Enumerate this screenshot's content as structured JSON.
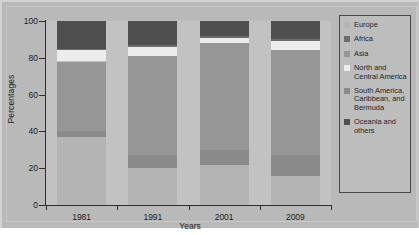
{
  "figure": {
    "background": "#b9b9b9",
    "plot_background": "#c2c2c2"
  },
  "chart_data": {
    "type": "bar",
    "subtype": "stacked-bar-100-percent",
    "title": "",
    "xlabel": "Years",
    "ylabel": "Percentages",
    "categories": [
      "1981",
      "1991",
      "2001",
      "2009"
    ],
    "ylim": [
      0,
      100
    ],
    "yticks": [
      0,
      20,
      40,
      60,
      80,
      100
    ],
    "grid": false,
    "legend_position": "right",
    "stack_order_bottom_to_top": [
      "Europe",
      "South America, Caribbean, and Bermuda",
      "Asia",
      "North and Central America",
      "Africa",
      "Oceania and others"
    ],
    "series": [
      {
        "name": "Europe",
        "color": "#b4b4b4",
        "values": [
          37,
          20,
          22,
          16
        ]
      },
      {
        "name": "South America, Caribbean, and Bermuda",
        "color": "#8a8a8a",
        "values": [
          3,
          7,
          8,
          11
        ]
      },
      {
        "name": "Asia",
        "color": "#969696",
        "values": [
          38,
          54,
          58,
          57
        ]
      },
      {
        "name": "North and Central America",
        "color": "#ececec",
        "values": [
          6,
          5,
          3,
          5
        ]
      },
      {
        "name": "Africa",
        "color": "#6d6d6d",
        "values": [
          1,
          1,
          1,
          1
        ]
      },
      {
        "name": "Oceania and others",
        "color": "#4f4f4f",
        "values": [
          15,
          13,
          8,
          10
        ]
      }
    ]
  },
  "legend": {
    "entries": [
      {
        "label": "Europe",
        "color": "#b4b4b4"
      },
      {
        "label": "Africa",
        "color": "#6d6d6d"
      },
      {
        "label": "Asia",
        "color": "#969696"
      },
      {
        "label": "North and\nCentral America",
        "color": "#ececec"
      },
      {
        "label": "South America,\nCaribbean, and\nBermuda",
        "color": "#8a8a8a"
      },
      {
        "label": "Oceania and\nothers",
        "color": "#4f4f4f"
      }
    ]
  }
}
